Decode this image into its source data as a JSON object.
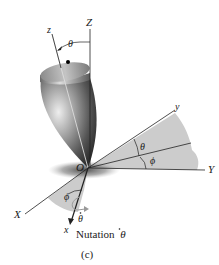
{
  "figure": {
    "caption": "(c)",
    "motion_label": "Nutation",
    "motion_symbol": "θ",
    "axes": {
      "Z": "Z",
      "z": "z",
      "Y": "Y",
      "y": "y",
      "X": "X",
      "x": "x",
      "origin": "O"
    },
    "angles": {
      "theta_top": "θ",
      "theta_right": "θ",
      "phi_right": "ϕ",
      "phi_left": "ϕ",
      "theta_dot": "θ"
    },
    "colors": {
      "shading": "#c8c8c8",
      "body_light": "#d9d9d9",
      "body_dark": "#4a4a4a",
      "line": "#222222",
      "arrow": "#999999"
    }
  }
}
